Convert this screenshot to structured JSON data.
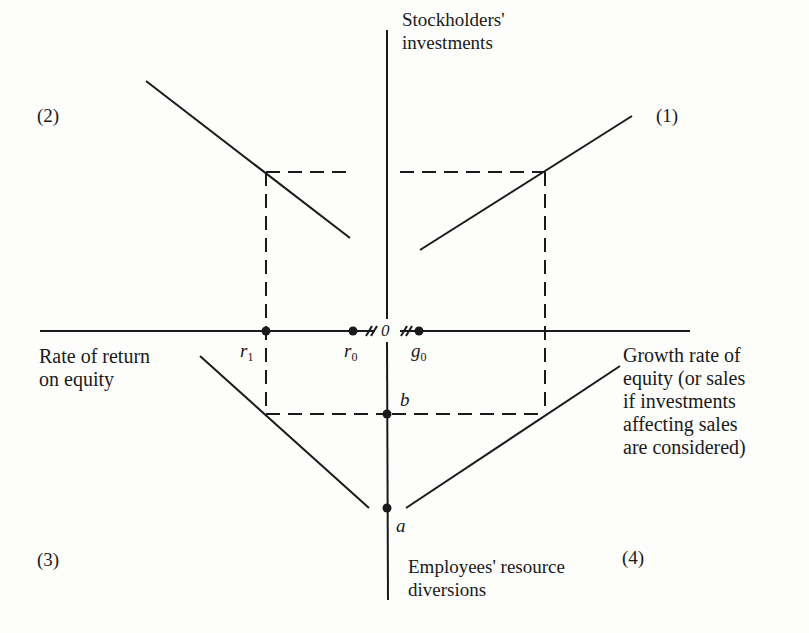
{
  "diagram": {
    "axes": {
      "vertical_top": [
        "Stockholders'",
        "investments"
      ],
      "vertical_bottom": [
        "Employees' resource",
        "diversions"
      ],
      "horizontal_left": [
        "Rate of return",
        "on equity"
      ],
      "horizontal_right": [
        "Growth rate of",
        "equity (or sales",
        "if investments",
        "affecting sales",
        "are considered)"
      ],
      "origin": "0"
    },
    "quadrants": {
      "q1": "(1)",
      "q2": "(2)",
      "q3": "(3)",
      "q4": "(4)"
    },
    "points": {
      "r1": "r",
      "r1_sub": "1",
      "r0": "r",
      "r0_sub": "0",
      "g0": "g",
      "g0_sub": "0",
      "a": "a",
      "b": "b"
    },
    "colors": {
      "ink": "#1a1a1a",
      "paper": "#fdfdfc"
    }
  }
}
